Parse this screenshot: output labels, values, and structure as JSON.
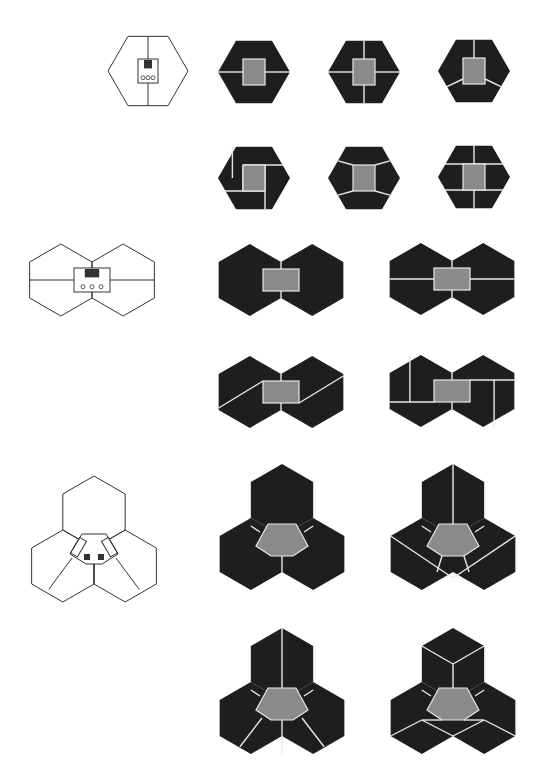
{
  "colors": {
    "dark": "#1e1e1e",
    "core": "#8a8a8a",
    "line": "#e8e8e8",
    "outline": "#333333",
    "background": "#ffffff"
  },
  "rows": [
    {
      "name": "single-hexagon",
      "plan": {
        "type": "hex1",
        "cx": 148,
        "cy": 71,
        "r": 40
      },
      "variants": [
        {
          "cx": 254,
          "cy": 72,
          "r": 36,
          "cuts": "h"
        },
        {
          "cx": 364,
          "cy": 72,
          "r": 36,
          "cuts": "plus"
        },
        {
          "cx": 474,
          "cy": 71,
          "r": 36,
          "cuts": "y"
        },
        {
          "cx": 254,
          "cy": 178,
          "r": 36,
          "cuts": "pinwheel"
        },
        {
          "cx": 364,
          "cy": 178,
          "r": 36,
          "cuts": "diag"
        },
        {
          "cx": 474,
          "cy": 177,
          "r": 36,
          "cuts": "grid"
        }
      ]
    },
    {
      "name": "double-hexagon",
      "plan": {
        "type": "hex2",
        "cx": 92,
        "cy": 280,
        "r": 36
      },
      "variants": [
        {
          "cx": 281,
          "cy": 280,
          "r": 36,
          "cuts": "none"
        },
        {
          "cx": 452,
          "cy": 279,
          "r": 36,
          "cuts": "h"
        },
        {
          "cx": 281,
          "cy": 392,
          "r": 36,
          "cuts": "z"
        },
        {
          "cx": 452,
          "cy": 391,
          "r": 36,
          "cuts": "blocks"
        }
      ]
    },
    {
      "name": "triple-hexagon",
      "plan": {
        "type": "hex3",
        "cx": 94,
        "cy": 548,
        "r": 36
      },
      "variants": [
        {
          "cx": 282,
          "cy": 536,
          "r": 36,
          "cuts": "none"
        },
        {
          "cx": 453,
          "cy": 536,
          "r": 36,
          "cuts": "fan"
        },
        {
          "cx": 282,
          "cy": 700,
          "r": 36,
          "cuts": "spokes"
        },
        {
          "cx": 453,
          "cy": 700,
          "r": 36,
          "cuts": "cubes"
        }
      ]
    }
  ]
}
